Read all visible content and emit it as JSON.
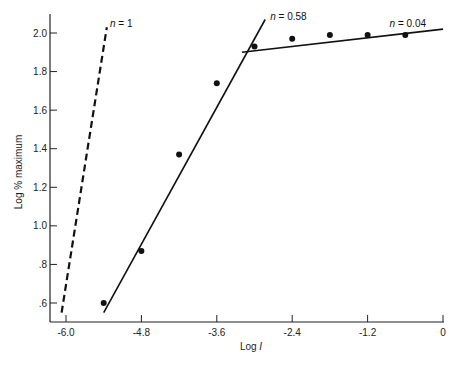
{
  "chart_data": {
    "type": "scatter",
    "title": "",
    "xlabel": "Log I",
    "xlabel_parts": {
      "prefix": "Log ",
      "italic": "I"
    },
    "ylabel": "Log % maximum",
    "xlim": [
      -6.0,
      0
    ],
    "ylim": [
      0.5,
      2.1
    ],
    "grid": false,
    "legend": null,
    "x_ticks": [
      -6.0,
      -4.8,
      -3.6,
      -2.4,
      -1.2,
      0
    ],
    "x_tick_labels": [
      "-6.0",
      "-4.8",
      "-3.6",
      "-2.4",
      "-1.2",
      "0"
    ],
    "y_ticks": [
      0.6,
      0.8,
      1.0,
      1.2,
      1.4,
      1.6,
      1.8,
      2.0
    ],
    "y_tick_labels": [
      ".6",
      ".8",
      "1.0",
      "1.2",
      "1.4",
      "1.6",
      "1.8",
      "2.0"
    ],
    "series": [
      {
        "name": "data points",
        "type": "scatter",
        "x": [
          -5.4,
          -4.8,
          -4.2,
          -3.6,
          -3.0,
          -2.4,
          -1.8,
          -1.2,
          -0.6
        ],
        "y": [
          0.6,
          0.87,
          1.37,
          1.74,
          1.93,
          1.97,
          1.99,
          1.99,
          1.99
        ]
      },
      {
        "name": "n = 1",
        "type": "line",
        "style": "dashed",
        "x": [
          -6.07,
          -5.35
        ],
        "y": [
          0.55,
          2.03
        ]
      },
      {
        "name": "n = 0.58",
        "type": "line",
        "style": "solid",
        "x": [
          -5.4,
          -2.83
        ],
        "y": [
          0.55,
          2.07
        ]
      },
      {
        "name": "n = 0.04",
        "type": "line",
        "style": "solid",
        "x": [
          -3.2,
          0
        ],
        "y": [
          1.9,
          2.02
        ]
      }
    ],
    "annotations": [
      {
        "text_italic": "n",
        "text": " = 1",
        "x": -5.3,
        "y": 2.03
      },
      {
        "text_italic": "n",
        "text": " = 0.58",
        "x": -2.75,
        "y": 2.07
      },
      {
        "text_italic": "n",
        "text": " = 0.04",
        "x": -0.85,
        "y": 2.03
      }
    ]
  }
}
